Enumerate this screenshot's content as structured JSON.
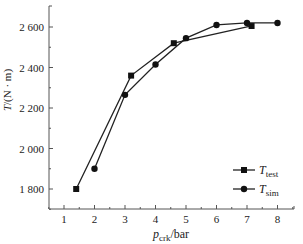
{
  "chart_data": {
    "type": "line",
    "title": "",
    "xlabel": "p_crk/bar",
    "xlabel_main": "p",
    "xlabel_sub": "crk",
    "xlabel_unit": "/bar",
    "ylabel": "T/(N·m)",
    "ylabel_main": "T",
    "ylabel_unit": "/(N · m)",
    "xlim": [
      0.5,
      8.5
    ],
    "ylim": [
      1700,
      2720
    ],
    "x_ticks": [
      1,
      2,
      3,
      4,
      5,
      6,
      7,
      8
    ],
    "x_tick_labels": [
      "1",
      "2",
      "3",
      "4",
      "5",
      "6",
      "7",
      "8"
    ],
    "y_ticks": [
      1800,
      2000,
      2200,
      2400,
      2600
    ],
    "y_tick_labels": [
      "1 800",
      "2 000",
      "2 200",
      "2 400",
      "2 600"
    ],
    "grid": false,
    "legend_position": "lower right",
    "series": [
      {
        "name": "T_test",
        "label_main": "T",
        "label_sub": "test",
        "marker": "square",
        "color": "#222222",
        "x": [
          1.4,
          3.2,
          4.6,
          7.15
        ],
        "y": [
          1800,
          2360,
          2520,
          2605
        ]
      },
      {
        "name": "T_sim",
        "label_main": "T",
        "label_sub": "sim",
        "marker": "circle",
        "color": "#222222",
        "x": [
          2.0,
          3.0,
          4.0,
          5.0,
          6.0,
          7.0,
          8.0
        ],
        "y": [
          1900,
          2265,
          2415,
          2545,
          2610,
          2620,
          2620
        ]
      }
    ]
  }
}
